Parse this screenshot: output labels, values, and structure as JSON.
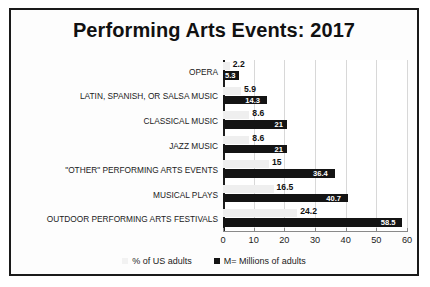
{
  "chart_data": {
    "type": "bar",
    "orientation": "horizontal",
    "title": "Performing Arts Events: 2017",
    "xlabel": "",
    "ylabel": "",
    "xlim": [
      0,
      60
    ],
    "xticks": [
      0,
      10,
      20,
      30,
      40,
      50,
      60
    ],
    "grid": true,
    "legend_position": "bottom",
    "categories": [
      "OPERA",
      "LATIN, SPANISH, OR SALSA MUSIC",
      "CLASSICAL MUSIC",
      "JAZZ MUSIC",
      "\"OTHER\" PERFORMING ARTS EVENTS",
      "MUSICAL PLAYS",
      "OUTDOOR PERFORMING ARTS FESTIVALS"
    ],
    "series": [
      {
        "name": "% of US adults",
        "color": "#EFEFEF",
        "values": [
          2.2,
          5.9,
          8.6,
          8.6,
          15,
          16.5,
          24.2
        ],
        "labels": [
          "2.2",
          "5.9",
          "8.6",
          "8.6",
          "15",
          "16.5",
          "24.2"
        ]
      },
      {
        "name": "M= Millions of adults",
        "color": "#141414",
        "values": [
          5.3,
          14.3,
          21,
          21,
          36.4,
          40.7,
          58.5
        ],
        "labels": [
          "5.3",
          "14.3",
          "21",
          "21",
          "36.4",
          "40.7",
          "58.5"
        ]
      }
    ]
  },
  "legend": {
    "items": [
      {
        "label": "% of US adults"
      },
      {
        "label": "M= Millions of adults"
      }
    ]
  }
}
